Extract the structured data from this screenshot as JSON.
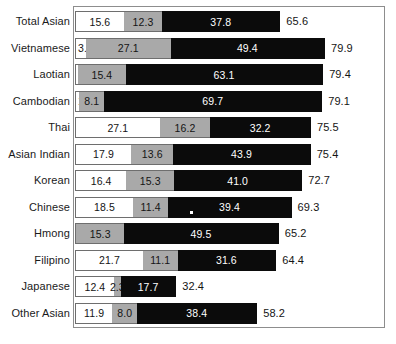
{
  "chart_data": {
    "type": "bar",
    "orientation": "horizontal",
    "stacked": true,
    "title": "",
    "subtitle": "",
    "xlabel": "",
    "ylabel": "",
    "grid": false,
    "legend": "none",
    "axis_visible": false,
    "xlim": [
      0,
      100
    ],
    "categories": [
      "Total Asian",
      "Vietnamese",
      "Laotian",
      "Cambodian",
      "Thai",
      "Asian Indian",
      "Korean",
      "Chinese",
      "Hmong",
      "Filipino",
      "Japanese",
      "Other Asian"
    ],
    "series": [
      {
        "name": "segment-1",
        "color": "#ffffff",
        "values": [
          15.6,
          3.5,
          0.9,
          1.3,
          27.1,
          17.9,
          16.4,
          18.5,
          0.4,
          21.7,
          12.4,
          11.9
        ],
        "labels": [
          "15.6",
          "3.5",
          ".9",
          "1.3",
          "27.1",
          "17.9",
          "16.4",
          "18.5",
          "0.4",
          "21.7",
          "12.4",
          "11.9"
        ]
      },
      {
        "name": "segment-2",
        "color": "#a9a9a9",
        "values": [
          12.3,
          27.1,
          15.4,
          8.1,
          16.2,
          13.6,
          15.3,
          11.4,
          15.3,
          11.1,
          2.3,
          8.0
        ],
        "labels": [
          "12.3",
          "27.1",
          "15.4",
          "8.1",
          "16.2",
          "13.6",
          "15.3",
          "11.4",
          "15.3",
          "11.1",
          "2.3",
          "8.0"
        ]
      },
      {
        "name": "segment-3",
        "color": "#0b0b0b",
        "values": [
          37.8,
          49.4,
          63.1,
          69.7,
          32.2,
          43.9,
          41.0,
          39.4,
          49.5,
          31.6,
          17.7,
          38.4
        ],
        "labels": [
          "37.8",
          "49.4",
          "63.1",
          "69.7",
          "32.2",
          "43.9",
          "41.0",
          "39.4",
          "49.5",
          "31.6",
          "17.7",
          "38.4"
        ]
      }
    ],
    "totals": [
      65.6,
      79.9,
      79.4,
      79.1,
      75.5,
      75.4,
      72.7,
      69.3,
      65.2,
      64.4,
      32.4,
      58.2
    ],
    "total_labels": [
      "65.6",
      "79.9",
      "79.4",
      "79.1",
      "75.5",
      "75.4",
      "72.7",
      "69.3",
      "65.2",
      "64.4",
      "32.4",
      "58.2"
    ]
  },
  "layout": {
    "px_per_unit": 3.125,
    "bar_left_px": 75,
    "row_top_px": 11,
    "row_pitch_px": 26.5,
    "bar_height_px": 21,
    "total_gap_px": 6
  }
}
